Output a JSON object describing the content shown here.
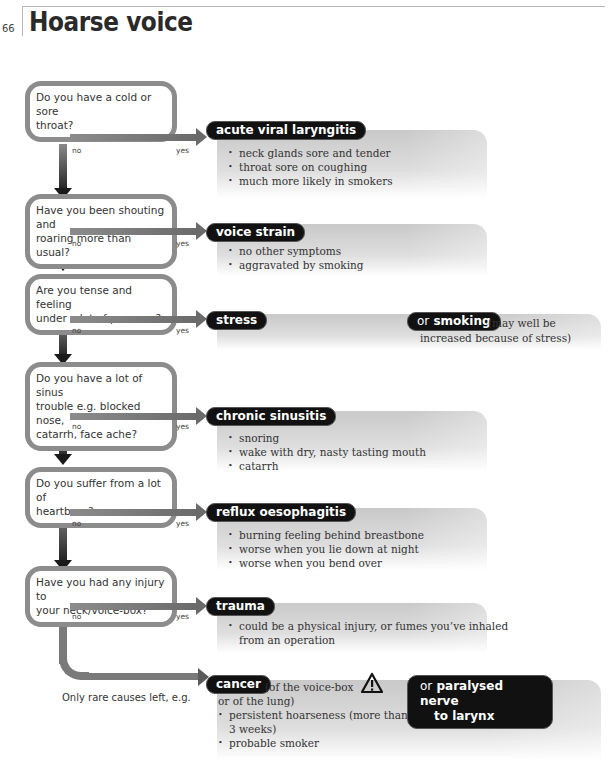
{
  "page": {
    "number": "66",
    "title": "Hoarse voice"
  },
  "branch_labels": {
    "no": "no",
    "yes": "yes"
  },
  "questions": [
    {
      "lines": [
        "Do you have a cold or sore",
        "throat?"
      ]
    },
    {
      "lines": [
        "Have you been shouting and",
        "roaring more than usual?"
      ]
    },
    {
      "lines": [
        "Are you tense and feeling",
        "under a lot of pressure?"
      ]
    },
    {
      "lines": [
        "Do you have a lot of sinus",
        "trouble e.g. blocked nose,",
        "catarrh, face ache?"
      ]
    },
    {
      "lines": [
        "Do you suffer from a lot of",
        "heartburn?"
      ]
    },
    {
      "lines": [
        "Have you had any injury to",
        "your neck/voice-box?"
      ]
    }
  ],
  "outcomes": [
    {
      "diagnosis": "acute viral laryngitis",
      "bullets": [
        "neck glands sore and tender",
        "throat sore on coughing",
        "much more likely in smokers"
      ]
    },
    {
      "diagnosis": "voice strain",
      "bullets": [
        "no other symptoms",
        "aggravated by smoking"
      ]
    },
    {
      "diagnosis": "stress",
      "alt_prefix": "or",
      "alt_diagnosis": "smoking",
      "alt_note_1": "(may well be",
      "alt_note_2": "increased because of stress)"
    },
    {
      "diagnosis": "chronic sinusitis",
      "bullets": [
        "snoring",
        "wake with dry, nasty tasting mouth",
        "catarrh"
      ]
    },
    {
      "diagnosis": "reflux oesophagitis",
      "bullets": [
        "burning feeling behind breastbone",
        "worse when you lie down at night",
        "worse when you bend over"
      ]
    },
    {
      "diagnosis": "trauma",
      "bullets": [
        "could be a physical injury, or fumes you’ve inhaled",
        "from an operation"
      ]
    }
  ],
  "final": {
    "lead_in": "Only rare causes left, e.g.",
    "diagnosis": "cancer",
    "note_1": "(of the voice-box",
    "note_2": "or of the lung)",
    "bullets": [
      "persistent hoarseness (more than",
      "3 weeks)",
      "probable smoker"
    ],
    "warning_icon": "warning-triangle-icon",
    "alt_prefix": "or",
    "alt_line_1": "paralysed nerve",
    "alt_line_2": "to larynx"
  },
  "colors": {
    "pill": "#111111",
    "border": "#8c8c8c",
    "panel_top": "#c9c9c9",
    "arrow_dark": "#1a1a1a"
  }
}
